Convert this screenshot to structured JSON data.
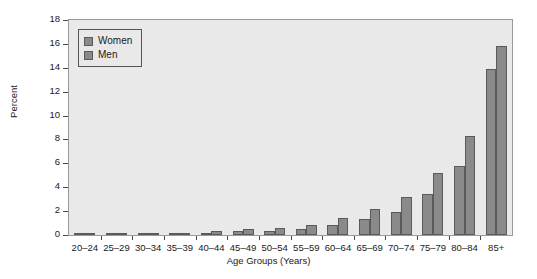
{
  "chart_data": {
    "type": "bar",
    "title": "",
    "xlabel": "Age Groups (Years)",
    "ylabel": "Percent",
    "ylim": [
      0,
      18
    ],
    "ytick_step": 2,
    "yticks": [
      0,
      2,
      4,
      6,
      8,
      10,
      12,
      14,
      16,
      18
    ],
    "grid": false,
    "legend_position": "upper left (inside axes)",
    "categories": [
      "20–24",
      "25–29",
      "30–34",
      "35–39",
      "40–44",
      "45–49",
      "50–54",
      "55–59",
      "60–64",
      "65–69",
      "70–74",
      "75–79",
      "80–84",
      "85+"
    ],
    "series": [
      {
        "name": "Women",
        "color": "#8a8a8a",
        "values": [
          0.1,
          0.1,
          0.1,
          0.15,
          0.2,
          0.3,
          0.35,
          0.5,
          0.8,
          1.3,
          1.9,
          3.4,
          5.8,
          13.9
        ]
      },
      {
        "name": "Men",
        "color": "#8a8a8a",
        "values": [
          0.1,
          0.15,
          0.15,
          0.2,
          0.35,
          0.5,
          0.6,
          0.8,
          1.4,
          2.2,
          3.2,
          5.2,
          8.3,
          15.8
        ]
      }
    ]
  },
  "legend": {
    "items": [
      {
        "label": "Women",
        "swatch": "legend-swatch-women"
      },
      {
        "label": "Men",
        "swatch": "legend-swatch-men"
      }
    ]
  },
  "colors": {
    "plot_background": "#e9e9e9",
    "figure_background": "#ffffff",
    "bar_fill": "#8a8a8a",
    "bar_edge": "#5a5a5a",
    "axis": "#4a4a4a",
    "text": "#1a1a1a"
  }
}
